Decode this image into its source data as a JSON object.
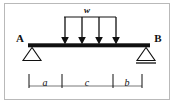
{
  "figure": {
    "type": "structural-beam-diagram",
    "frame_color": "#b9b9b9",
    "background_color": "#ffffff",
    "ink_color": "#101010"
  },
  "labels": {
    "support_left": "A",
    "support_right": "B",
    "load": "w",
    "dim_left": "a",
    "dim_center": "c",
    "dim_right": "b"
  },
  "geometry": {
    "beam": {
      "x1": 28,
      "x2": 150,
      "y": 45,
      "thickness": 4
    },
    "supports": [
      {
        "name": "pin",
        "label": "A",
        "x": 32,
        "y": 47,
        "half_width": 9,
        "height": 13
      },
      {
        "name": "roller",
        "label": "B",
        "x": 146,
        "y": 47,
        "half_width": 9,
        "height": 13,
        "base_line": true
      }
    ],
    "load_line": {
      "x1": 64,
      "x2": 116,
      "y": 17
    },
    "arrows": [
      {
        "x": 65,
        "y_top": 17,
        "y_tip": 43
      },
      {
        "x": 82,
        "y_top": 17,
        "y_tip": 43
      },
      {
        "x": 99,
        "y_top": 17,
        "y_tip": 43
      },
      {
        "x": 116,
        "y_top": 17,
        "y_tip": 43
      }
    ],
    "dimension_line": {
      "y": 86,
      "x1": 29,
      "x2": 142
    },
    "dimension_ticks": [
      29,
      62,
      113,
      142
    ],
    "dimension_tick_top": 74,
    "dimension_segments": [
      {
        "label": "a",
        "x_center": 45
      },
      {
        "label": "c",
        "x_center": 87
      },
      {
        "label": "b",
        "x_center": 127
      }
    ]
  }
}
